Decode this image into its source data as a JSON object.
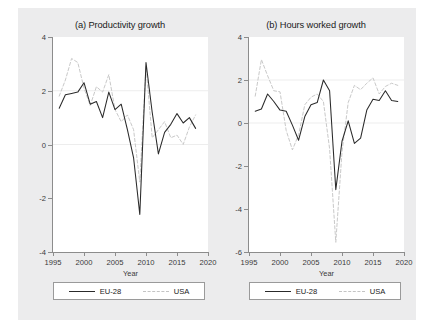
{
  "figure": {
    "background_color": "#ececed",
    "panel_background_color": "#ffffff",
    "series_colors": {
      "eu28": "#2a2a2a",
      "usa": "#c9c9c9"
    }
  },
  "legend": {
    "eu28_label": "EU-28",
    "usa_label": "USA"
  },
  "chart_data": [
    {
      "type": "line",
      "title": "(a) Productivity growth",
      "xlabel": "Year",
      "ylabel": "",
      "xlim": [
        1995,
        2020
      ],
      "ylim": [
        -4,
        4
      ],
      "xticks": [
        1995,
        2000,
        2005,
        2010,
        2015,
        2020
      ],
      "yticks": [
        -4,
        -2,
        0,
        2,
        4
      ],
      "grid": "horizontal gridlines at y=0 and y=2",
      "legend_position": "below plot, boxed",
      "series": [
        {
          "name": "EU-28",
          "style": "solid",
          "color": "#2a2a2a",
          "x": [
            1996,
            1997,
            1998,
            1999,
            2000,
            2001,
            2002,
            2003,
            2004,
            2005,
            2006,
            2007,
            2008,
            2009,
            2010,
            2011,
            2012,
            2013,
            2014,
            2015,
            2016,
            2017,
            2018
          ],
          "values": [
            1.35,
            1.85,
            1.9,
            1.95,
            2.3,
            1.5,
            1.6,
            1.0,
            1.95,
            1.3,
            1.5,
            0.55,
            -0.5,
            -2.6,
            3.05,
            1.2,
            -0.35,
            0.45,
            0.75,
            1.15,
            0.8,
            1.0,
            0.6
          ]
        },
        {
          "name": "USA",
          "style": "dashed",
          "color": "#c9c9c9",
          "x": [
            1996,
            1997,
            1998,
            1999,
            2000,
            2001,
            2002,
            2003,
            2004,
            2005,
            2006,
            2007,
            2008,
            2009,
            2010,
            2011,
            2012,
            2013,
            2014,
            2015,
            2016,
            2017,
            2018
          ],
          "values": [
            1.8,
            2.4,
            3.2,
            3.05,
            2.1,
            1.45,
            2.15,
            1.95,
            2.6,
            1.3,
            0.85,
            1.1,
            0.55,
            -1.4,
            2.9,
            0.25,
            0.55,
            0.85,
            0.25,
            0.35,
            0.0,
            0.65,
            1.1
          ]
        }
      ]
    },
    {
      "type": "line",
      "title": "(b) Hours worked growth",
      "xlabel": "Year",
      "ylabel": "",
      "xlim": [
        1995,
        2020
      ],
      "ylim": [
        -6,
        4
      ],
      "xticks": [
        1995,
        2000,
        2005,
        2010,
        2015,
        2020
      ],
      "yticks": [
        -6,
        -4,
        -2,
        0,
        2,
        4
      ],
      "grid": "horizontal gridlines at y=0 and y=2",
      "legend_position": "below plot, boxed",
      "series": [
        {
          "name": "EU-28",
          "style": "solid",
          "color": "#2a2a2a",
          "x": [
            1996,
            1997,
            1998,
            1999,
            2000,
            2001,
            2002,
            2003,
            2004,
            2005,
            2006,
            2007,
            2008,
            2009,
            2010,
            2011,
            2012,
            2013,
            2014,
            2015,
            2016,
            2017,
            2018,
            2019
          ],
          "values": [
            0.55,
            0.65,
            1.35,
            1.0,
            0.6,
            0.55,
            -0.1,
            -0.8,
            0.3,
            0.85,
            0.95,
            2.0,
            1.5,
            -3.1,
            -0.85,
            0.1,
            -0.95,
            -0.7,
            0.6,
            1.1,
            1.05,
            1.5,
            1.05,
            1.0
          ]
        },
        {
          "name": "USA",
          "style": "dashed",
          "color": "#c9c9c9",
          "x": [
            1996,
            1997,
            1998,
            1999,
            2000,
            2001,
            2002,
            2003,
            2004,
            2005,
            2006,
            2007,
            2008,
            2009,
            2010,
            2011,
            2012,
            2013,
            2014,
            2015,
            2016,
            2017,
            2018,
            2019
          ],
          "values": [
            1.25,
            2.95,
            2.2,
            1.5,
            1.45,
            -0.35,
            -1.25,
            -0.55,
            0.85,
            1.2,
            1.35,
            1.0,
            -1.2,
            -5.55,
            -1.35,
            0.95,
            1.75,
            1.55,
            1.85,
            2.1,
            1.35,
            1.7,
            1.85,
            1.75
          ]
        }
      ]
    }
  ]
}
